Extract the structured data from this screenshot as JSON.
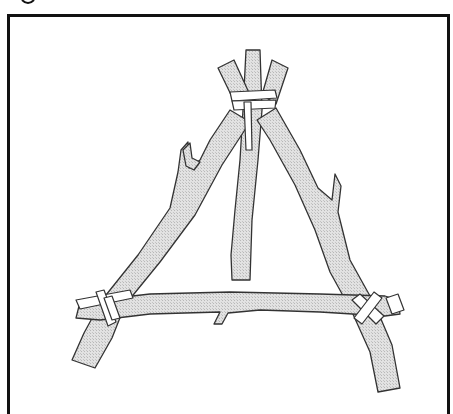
{
  "figure": {
    "parts": [
      {
        "name": "left-leg"
      },
      {
        "name": "right-leg"
      },
      {
        "name": "center-pole"
      },
      {
        "name": "bottom-crossbar"
      },
      {
        "name": "top-lashing"
      },
      {
        "name": "left-corner-lashing"
      },
      {
        "name": "right-corner-lashing"
      }
    ],
    "colors": {
      "wood_fill": "#d9d9d9",
      "outline": "#333333",
      "frame": "#111111",
      "background": "#ffffff"
    }
  }
}
